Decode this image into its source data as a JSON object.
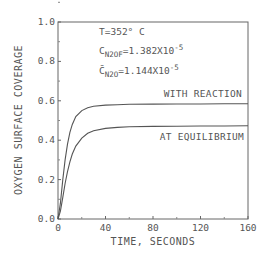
{
  "chart_data": {
    "type": "line",
    "title": "",
    "xlabel": "TIME, SECONDS",
    "ylabel": "OXYGEN SURFACE COVERAGE",
    "xlim": [
      0,
      160
    ],
    "ylim": [
      0.0,
      1.0
    ],
    "x_ticks": [
      "0",
      "40",
      "80",
      "120",
      "160"
    ],
    "y_ticks": [
      "0.0",
      "0.2",
      "0.4",
      "0.6",
      "0.8",
      "1.0"
    ],
    "grid": false,
    "annotations": {
      "line1": "T=352° C",
      "line2_main": "C",
      "line2_sub": "N2OF",
      "line2_rest": "=1.382X10",
      "line2_exp": "-5",
      "line3_main": "C̄",
      "line3_sub": "N2O",
      "line3_rest": "=1.144X10",
      "line3_exp": "-5"
    },
    "series": [
      {
        "name": "WITH REACTION",
        "x": [
          0,
          2,
          4,
          6,
          8,
          10,
          12,
          15,
          20,
          25,
          30,
          40,
          50,
          60,
          80,
          100,
          120,
          140,
          160
        ],
        "y": [
          0.0,
          0.08,
          0.2,
          0.3,
          0.38,
          0.44,
          0.48,
          0.52,
          0.55,
          0.565,
          0.572,
          0.578,
          0.58,
          0.582,
          0.583,
          0.584,
          0.584,
          0.585,
          0.585
        ]
      },
      {
        "name": "AT EQUILIBRIUM",
        "x": [
          0,
          2,
          4,
          6,
          8,
          10,
          12,
          15,
          20,
          25,
          30,
          40,
          50,
          60,
          80,
          100,
          120,
          140,
          160
        ],
        "y": [
          0.0,
          0.04,
          0.11,
          0.18,
          0.24,
          0.29,
          0.33,
          0.37,
          0.41,
          0.435,
          0.448,
          0.46,
          0.465,
          0.468,
          0.47,
          0.471,
          0.472,
          0.472,
          0.473
        ]
      }
    ]
  }
}
